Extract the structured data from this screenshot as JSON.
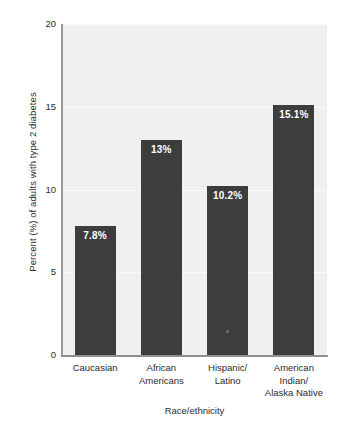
{
  "chart_data": {
    "type": "bar",
    "title": "",
    "xlabel": "Race/ethnicity",
    "ylabel": "Percent (%) of adults with type 2 diabetes",
    "categories": [
      "Caucasian",
      "African\nAmericans",
      "Hispanic/\nLatino",
      "American\nIndian/\nAlaska Native"
    ],
    "values": [
      7.8,
      13,
      10.2,
      15.1
    ],
    "data_labels": [
      "7.8%",
      "13%",
      "10.2%",
      "15.1%"
    ],
    "ylim": [
      0,
      20
    ],
    "yticks": [
      0,
      5,
      10,
      15,
      20
    ],
    "ytick_labels": [
      "0",
      "5",
      "10",
      "15",
      "20"
    ],
    "grid": true,
    "legend": "none",
    "bar_color": "#3d3d3d",
    "plot_background": "#f0f0f0",
    "gridline_color": "#fafafa",
    "figure_background": "#ffffff",
    "text_color": "#2b2b2b",
    "data_label_color": "#ffffff"
  }
}
